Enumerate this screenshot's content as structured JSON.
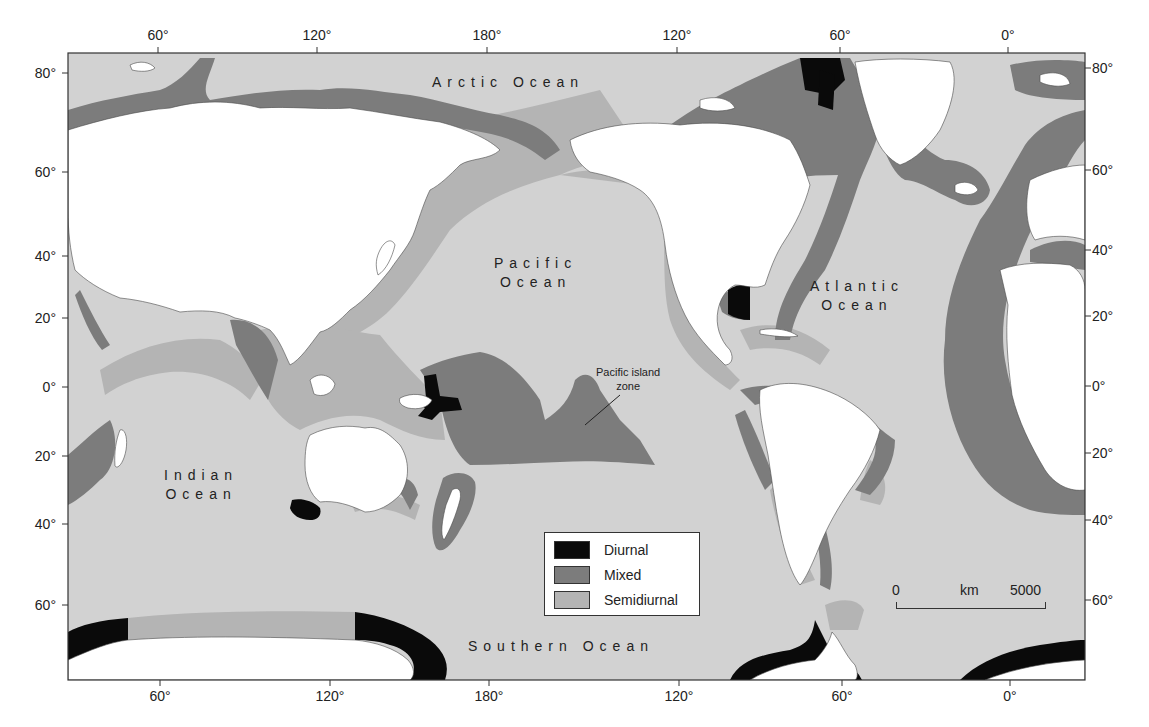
{
  "map": {
    "title": "Global tide types",
    "frame": {
      "x0": 68,
      "y0": 53,
      "x1": 1085,
      "y1": 680
    },
    "colors": {
      "land": "#ffffff",
      "ocean": "#d2d2d2",
      "semidiurnal": "#b4b4b4",
      "mixed": "#7c7c7c",
      "diurnal": "#0a0a0a",
      "frame": "#333333"
    },
    "longitude_ticks_top": [
      {
        "label": "60°",
        "x": 158
      },
      {
        "label": "120°",
        "x": 317
      },
      {
        "label": "180°",
        "x": 487
      },
      {
        "label": "120°",
        "x": 677
      },
      {
        "label": "60°",
        "x": 840
      },
      {
        "label": "0°",
        "x": 1008
      }
    ],
    "longitude_ticks_bottom": [
      {
        "label": "60°",
        "x": 160
      },
      {
        "label": "120°",
        "x": 330
      },
      {
        "label": "180°",
        "x": 489
      },
      {
        "label": "120°",
        "x": 679
      },
      {
        "label": "60°",
        "x": 842
      },
      {
        "label": "0°",
        "x": 1010
      }
    ],
    "latitude_ticks_left": [
      {
        "label": "80°",
        "y": 73
      },
      {
        "label": "60°",
        "y": 172
      },
      {
        "label": "40°",
        "y": 256
      },
      {
        "label": "20°",
        "y": 318
      },
      {
        "label": "0°",
        "y": 387
      },
      {
        "label": "20°",
        "y": 456
      },
      {
        "label": "40°",
        "y": 524
      },
      {
        "label": "60°",
        "y": 605
      }
    ],
    "latitude_ticks_right": [
      {
        "label": "80°",
        "y": 68
      },
      {
        "label": "60°",
        "y": 170
      },
      {
        "label": "40°",
        "y": 250
      },
      {
        "label": "20°",
        "y": 316
      },
      {
        "label": "0°",
        "y": 386
      },
      {
        "label": "20°",
        "y": 453
      },
      {
        "label": "40°",
        "y": 520
      },
      {
        "label": "60°",
        "y": 600
      }
    ],
    "ocean_labels": [
      {
        "text": "Arctic Ocean",
        "x": 432,
        "y": 76
      },
      {
        "text": "Pacific Ocean",
        "x": 494,
        "y": 257,
        "lines": [
          "Pacific",
          "Ocean"
        ]
      },
      {
        "text": "Atlantic Ocean",
        "x": 808,
        "y": 278,
        "lines": [
          "Atlantic",
          "Ocean"
        ]
      },
      {
        "text": "Indian Ocean",
        "x": 164,
        "y": 467,
        "lines": [
          "Indian",
          "Ocean"
        ]
      },
      {
        "text": "Southern Ocean",
        "x": 468,
        "y": 640
      }
    ],
    "annotation": {
      "line1": "Pacific island",
      "line2": "zone"
    },
    "legend": {
      "items": [
        {
          "label": "Diurnal",
          "color": "#0a0a0a"
        },
        {
          "label": "Mixed",
          "color": "#7c7c7c"
        },
        {
          "label": "Semidiurnal",
          "color": "#b4b4b4"
        }
      ]
    },
    "scale_bar": {
      "start": "0",
      "unit": "km",
      "end": "5000"
    }
  },
  "labels": {
    "arctic": "Arctic Ocean",
    "pacific_1": "Pacific",
    "pacific_2": "Ocean",
    "atlantic_1": "Atlantic",
    "atlantic_2": "Ocean",
    "indian_1": "Indian",
    "indian_2": "Ocean",
    "southern": "Southern Ocean"
  }
}
